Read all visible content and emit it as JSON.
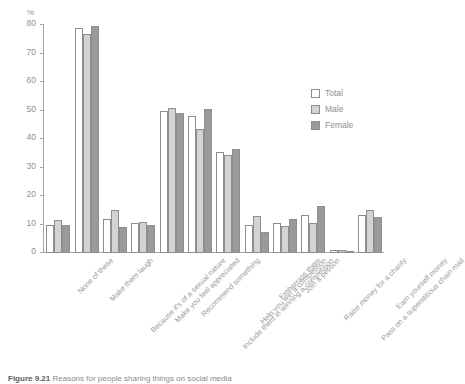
{
  "figure": {
    "axis_unit_label": "%",
    "caption_prefix": "Figure 9.21",
    "caption_text": "Reasons for people sharing things on social media"
  },
  "legend": {
    "position": "top-right",
    "entries": [
      {
        "label": "Total",
        "color": "#ffffff"
      },
      {
        "label": "Male",
        "color": "#d3d3d3"
      },
      {
        "label": "Female",
        "color": "#9a9a9a"
      }
    ]
  },
  "chart_data": {
    "type": "bar",
    "title": "",
    "xlabel": "",
    "ylabel": "%",
    "ylim": [
      0,
      80
    ],
    "yticks": [
      0,
      10,
      20,
      30,
      40,
      50,
      60,
      70,
      80
    ],
    "grid": false,
    "legend_position": "top-right",
    "categories": [
      "None of these",
      "Make them laugh",
      "Because it's of a sexual nature",
      "Make you feel appreciated",
      "Recommend something",
      "Include them in winning a competition",
      "Help you win a competition",
      "Embarrass them",
      "Join a petition",
      "Raise money for a charity",
      "Pass on a superstitious chain mail",
      "Earn yourself money"
    ],
    "series": [
      {
        "name": "Total",
        "color": "#ffffff",
        "values": [
          10,
          79,
          12,
          10.5,
          50,
          48,
          35.5,
          10,
          10.5,
          13.5,
          1,
          13.5
        ]
      },
      {
        "name": "Male",
        "color": "#d3d3d3",
        "values": [
          11.5,
          77,
          15,
          11,
          51,
          43.5,
          34.5,
          13,
          9.5,
          10.5,
          1,
          15
        ]
      },
      {
        "name": "Female",
        "color": "#9a9a9a",
        "values": [
          10,
          79.5,
          9,
          10,
          49,
          50.5,
          36.5,
          7.5,
          12,
          16.5,
          0.5,
          12.5
        ]
      }
    ]
  }
}
